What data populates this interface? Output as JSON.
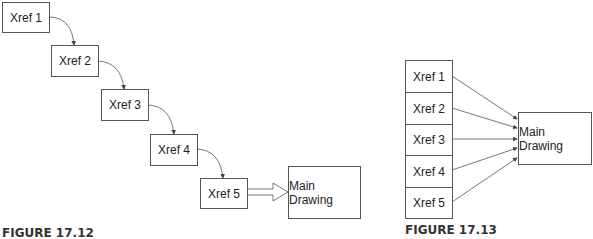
{
  "figure_left": {
    "caption": "FIGURE 17.12",
    "xrefs": [
      {
        "label": "Xref 1"
      },
      {
        "label": "Xref 2"
      },
      {
        "label": "Xref 3"
      },
      {
        "label": "Xref 4"
      },
      {
        "label": "Xref 5"
      }
    ],
    "main": {
      "label": "Main Drawing"
    }
  },
  "figure_right": {
    "caption": "FIGURE 17.13",
    "xrefs": [
      {
        "label": "Xref 1"
      },
      {
        "label": "Xref 2"
      },
      {
        "label": "Xref 3"
      },
      {
        "label": "Xref 4"
      },
      {
        "label": "Xref 5"
      }
    ],
    "main": {
      "label": "Main Drawing"
    }
  },
  "colors": {
    "line": "#555555",
    "text": "#222222",
    "caption": "#333333"
  }
}
